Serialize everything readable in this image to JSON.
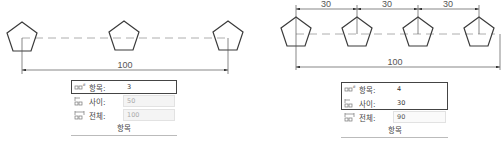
{
  "left_figure": {
    "pentagon_count": 3,
    "total_dimension": "100",
    "panel": {
      "rows": [
        {
          "label": "항목:",
          "value": "3",
          "icon": "items-count-icon",
          "state": "active"
        },
        {
          "label": "사이:",
          "value": "50",
          "icon": "between-spacing-icon",
          "state": "disabled"
        },
        {
          "label": "전체:",
          "value": "100",
          "icon": "total-spacing-icon",
          "state": "disabled"
        }
      ],
      "footer": "항목"
    }
  },
  "right_figure": {
    "pentagon_count": 4,
    "spacing_dimensions": [
      "30",
      "30",
      "30"
    ],
    "total_dimension": "100",
    "panel": {
      "rows": [
        {
          "label": "항목:",
          "value": "4",
          "icon": "items-count-icon",
          "state": "active"
        },
        {
          "label": "사이:",
          "value": "30",
          "icon": "between-spacing-icon",
          "state": "active"
        },
        {
          "label": "전체:",
          "value": "90",
          "icon": "total-spacing-icon",
          "state": "normal"
        }
      ],
      "footer": "항목"
    }
  },
  "colors": {
    "stroke": "#3a3a3a",
    "dim_line": "#555555",
    "centerline": "#9a9a9a",
    "highlight_border": "#444444"
  }
}
